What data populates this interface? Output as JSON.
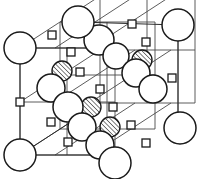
{
  "figure": {
    "background_color": "#ffffff",
    "line_color": "#4a4a4a",
    "outline_color": "#1a1a1a",
    "width": 198,
    "height": 179
  },
  "legend": {
    "species": [
      {
        "key": "large-open-circle",
        "label": "Large open circle",
        "role": "large ion site",
        "fill": "#ffffff",
        "stroke": "#1a1a1a"
      },
      {
        "key": "hatched-circle",
        "label": "Hatched circle",
        "role": "substituted / interstitial ion site",
        "fill": "#ffffff",
        "stroke": "#1a1a1a",
        "hatch": "diagonal"
      },
      {
        "key": "small-square",
        "label": "Small square node",
        "role": "small ion / lattice point",
        "fill": "#ffffff",
        "stroke": "#1a1a1a"
      }
    ]
  },
  "geometry": {
    "projection": "oblique",
    "grid_divisions": 2,
    "axis_a": {
      "dx": 71,
      "dy": 0
    },
    "axis_b": {
      "dx": 0,
      "dy": 58
    },
    "axis_c": {
      "dx": 40,
      "dy": -26
    },
    "origin": {
      "x": 20,
      "y": 155
    }
  },
  "big_circles": [
    {
      "name": "corner-front-bottom-left",
      "cx": 20,
      "cy": 155,
      "r": 16
    },
    {
      "name": "corner-front-top-left",
      "cx": 20,
      "cy": 48,
      "r": 16
    },
    {
      "name": "edge-front-bottom-center",
      "cx": 115,
      "cy": 163,
      "r": 16
    },
    {
      "name": "corner-back-top-center",
      "cx": 78,
      "cy": 22,
      "r": 16
    },
    {
      "name": "corner-back-top-right",
      "cx": 178,
      "cy": 25,
      "r": 16
    },
    {
      "name": "corner-back-bottom-right",
      "cx": 180,
      "cy": 128,
      "r": 16
    },
    {
      "name": "inner-top-center",
      "cx": 99,
      "cy": 40,
      "r": 15
    },
    {
      "name": "inner-upper-right",
      "cx": 116,
      "cy": 56,
      "r": 13
    },
    {
      "name": "inner-mid-right",
      "cx": 136,
      "cy": 73,
      "r": 14
    },
    {
      "name": "inner-center-right",
      "cx": 153,
      "cy": 89,
      "r": 14
    },
    {
      "name": "inner-mid-left",
      "cx": 51,
      "cy": 88,
      "r": 14
    },
    {
      "name": "inner-center-left",
      "cx": 68,
      "cy": 107,
      "r": 15
    },
    {
      "name": "inner-lower-left",
      "cx": 82,
      "cy": 127,
      "r": 14
    },
    {
      "name": "inner-lower-center",
      "cx": 100,
      "cy": 145,
      "r": 14
    }
  ],
  "hatched_circles": [
    {
      "name": "hatched-upper-left",
      "cx": 62,
      "cy": 71,
      "r": 10
    },
    {
      "name": "hatched-upper-right",
      "cx": 142,
      "cy": 60,
      "r": 10
    },
    {
      "name": "hatched-center",
      "cx": 91,
      "cy": 107,
      "r": 10
    },
    {
      "name": "hatched-lower-right",
      "cx": 110,
      "cy": 127,
      "r": 10
    }
  ],
  "square_nodes": [
    {
      "name": "square-back-top-left",
      "cx": 52,
      "cy": 35
    },
    {
      "name": "square-back-top-center",
      "cx": 132,
      "cy": 24
    },
    {
      "name": "square-back-top-right",
      "cx": 146,
      "cy": 42
    },
    {
      "name": "square-mid-upper-left",
      "cx": 71,
      "cy": 52
    },
    {
      "name": "square-mid-center-top",
      "cx": 80,
      "cy": 72
    },
    {
      "name": "square-front-left-mid",
      "cx": 20,
      "cy": 102
    },
    {
      "name": "square-center",
      "cx": 100,
      "cy": 89
    },
    {
      "name": "square-center-low",
      "cx": 113,
      "cy": 107
    },
    {
      "name": "square-right-mid",
      "cx": 172,
      "cy": 78
    },
    {
      "name": "square-mid-front-left",
      "cx": 51,
      "cy": 122
    },
    {
      "name": "square-front-bottom-center",
      "cx": 68,
      "cy": 142
    },
    {
      "name": "square-lower-right",
      "cx": 131,
      "cy": 125
    },
    {
      "name": "square-bottom-right",
      "cx": 146,
      "cy": 143
    }
  ]
}
